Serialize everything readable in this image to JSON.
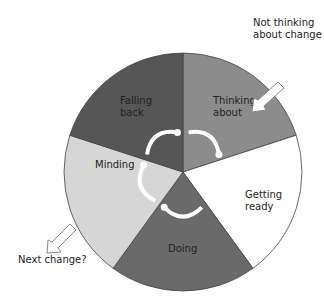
{
  "segments": [
    {
      "id": "thinking",
      "lines": [
        "Thinking",
        "about"
      ],
      "color": "#8c8c8c"
    },
    {
      "id": "getting-ready",
      "lines": [
        "Getting",
        "ready"
      ],
      "color": "#ffffff"
    },
    {
      "id": "doing",
      "lines": [
        "Doing"
      ],
      "color": "#6a6a6a"
    },
    {
      "id": "minding",
      "lines": [
        "Minding"
      ],
      "color": "#d6d6d6"
    },
    {
      "id": "falling-back",
      "lines": [
        "Falling",
        "back"
      ],
      "color": "#565656"
    }
  ],
  "entry": {
    "lines": [
      "Not thinking",
      "about change"
    ]
  },
  "exit": {
    "lines": [
      "Next change?"
    ]
  }
}
